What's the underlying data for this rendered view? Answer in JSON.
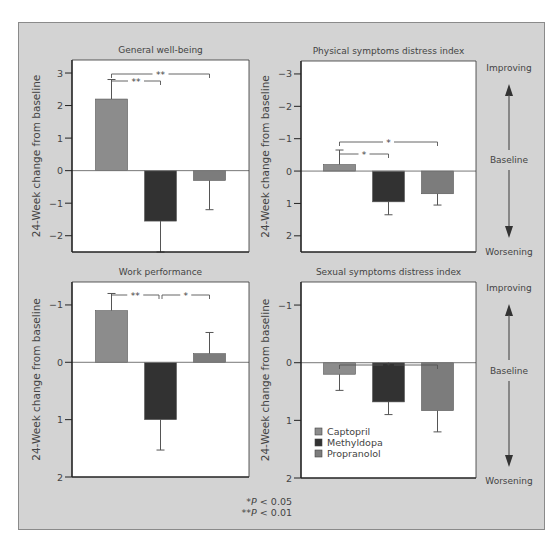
{
  "colors": {
    "frame_bg": "#d3d3d3",
    "frame_border": "#8a8a8a",
    "plot_bg": "#ffffff",
    "axis": "#222222",
    "Captopril": "#8c8c8c",
    "Methyldopa": "#323232",
    "Propranolol": "#7c7c7c",
    "text": "#444444"
  },
  "legend": {
    "items": [
      "Captopril",
      "Methyldopa",
      "Propranolol"
    ]
  },
  "significance_note": {
    "line1_prefix": "*",
    "line1_p": "P",
    "line1_rest": " < 0.05",
    "line2_prefix": "**",
    "line2_p": "P",
    "line2_rest": " < 0.01"
  },
  "side_labels": {
    "top": {
      "improving": "Improving",
      "baseline": "Baseline",
      "worsening": "Worsening"
    },
    "bottom": {
      "improving": "Improving",
      "baseline": "Baseline",
      "worsening": "Worsening"
    }
  },
  "chart_data": [
    {
      "type": "bar",
      "title": "General well-being",
      "ylabel": "24-Week change from baseline",
      "categories": [
        "Captopril",
        "Methyldopa",
        "Propranolol"
      ],
      "values": [
        2.2,
        -1.55,
        -0.3
      ],
      "error_bars": [
        2.8,
        -2.5,
        -1.2
      ],
      "yticks": [
        3,
        2,
        1,
        0,
        -1,
        -2
      ],
      "ylim": [
        -2.5,
        3.4
      ],
      "y_inverted": false,
      "significance": [
        {
          "from": 0,
          "to": 2,
          "label": "**",
          "level": 2
        },
        {
          "from": 0,
          "to": 1,
          "label": "**",
          "level": 1
        }
      ],
      "box": {
        "x": 72,
        "y": 60,
        "w": 177,
        "h": 192
      }
    },
    {
      "type": "bar",
      "title": "Physical symptoms distress index",
      "ylabel": "24-Week change from baseline",
      "categories": [
        "Captopril",
        "Methyldopa",
        "Propranolol"
      ],
      "values": [
        -0.2,
        0.95,
        0.7
      ],
      "error_bars": [
        -0.65,
        1.35,
        1.05
      ],
      "yticks": [
        -3,
        -2,
        -1,
        0,
        1,
        2
      ],
      "ylim": [
        -3.4,
        2.5
      ],
      "y_inverted": true,
      "significance": [
        {
          "from": 0,
          "to": 2,
          "label": "*",
          "level": 2
        },
        {
          "from": 0,
          "to": 1,
          "label": "*",
          "level": 1
        }
      ],
      "box": {
        "x": 301,
        "y": 61,
        "w": 175,
        "h": 191
      }
    },
    {
      "type": "bar",
      "title": "Work performance",
      "ylabel": "24-Week change from baseline",
      "categories": [
        "Captopril",
        "Methyldopa",
        "Propranolol"
      ],
      "values": [
        -0.9,
        1.0,
        -0.15
      ],
      "error_bars": [
        -1.2,
        1.53,
        -0.52
      ],
      "yticks": [
        -1,
        0,
        1,
        2
      ],
      "ylim": [
        -1.4,
        2.0
      ],
      "y_inverted": true,
      "significance": [
        {
          "from": 0,
          "to": 1,
          "label": "**",
          "level": 1
        },
        {
          "from": 1,
          "to": 2,
          "label": "*",
          "level": 1
        }
      ],
      "box": {
        "x": 72,
        "y": 282,
        "w": 177,
        "h": 195
      }
    },
    {
      "type": "bar",
      "title": "Sexual symptoms distress index",
      "ylabel": "24-Week change from baseline",
      "categories": [
        "Captopril",
        "Methyldopa",
        "Propranolol"
      ],
      "values": [
        0.2,
        0.68,
        0.83
      ],
      "error_bars": [
        0.48,
        0.9,
        1.2
      ],
      "yticks": [
        -1,
        0,
        1,
        2
      ],
      "ylim": [
        -1.4,
        2.0
      ],
      "y_inverted": true,
      "significance": [
        {
          "from": 0,
          "to": 2,
          "label": "*",
          "level": 1
        }
      ],
      "box": {
        "x": 301,
        "y": 282,
        "w": 175,
        "h": 196
      },
      "show_legend": true
    }
  ]
}
